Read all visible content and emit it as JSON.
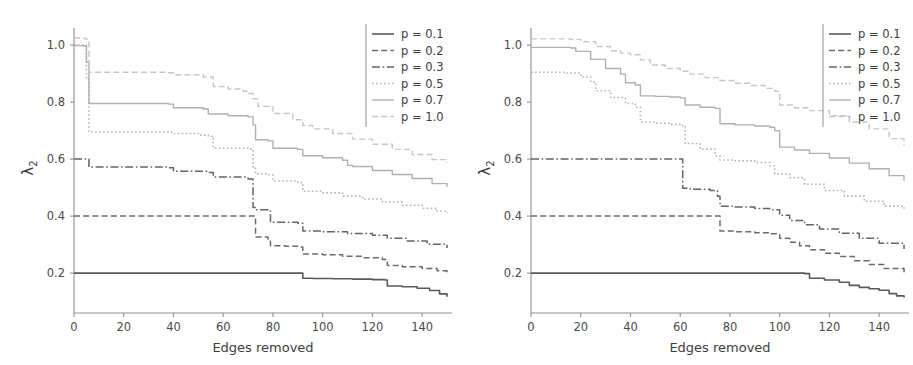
{
  "figure": {
    "background_color": "#ffffff",
    "panel_count": 2
  },
  "chart_data": [
    {
      "type": "line",
      "panel": "left",
      "title": "",
      "subtitle": "",
      "xlabel": "Edges removed",
      "ylabel": "λ₂",
      "xlim": [
        0,
        152
      ],
      "ylim": [
        0.06,
        1.06
      ],
      "xticks": [
        0,
        20,
        40,
        60,
        80,
        100,
        120,
        140
      ],
      "xtick_labels": [
        "0",
        "20",
        "40",
        "60",
        "80",
        "100",
        "120",
        "140"
      ],
      "yticks": [
        0.2,
        0.4,
        0.6,
        0.8,
        1.0
      ],
      "ytick_labels": [
        "0.2",
        "0.4",
        "0.6",
        "0.8",
        "1.0"
      ],
      "grid": false,
      "legend_position": "upper right",
      "legend_entries": [
        "p = 0.1",
        "p = 0.2",
        "p = 0.3",
        "p = 0.5",
        "p = 0.7",
        "p = 1.0"
      ],
      "series": [
        {
          "name": "p = 0.1",
          "color": "#5a5a5a",
          "linestyle": "solid",
          "linewidth": 1.6,
          "x": [
            0,
            91,
            92,
            96,
            104,
            112,
            120,
            125,
            126,
            132,
            138,
            143,
            147,
            150
          ],
          "values": [
            0.2,
            0.2,
            0.182,
            0.181,
            0.18,
            0.179,
            0.177,
            0.176,
            0.155,
            0.152,
            0.147,
            0.139,
            0.127,
            0.117
          ]
        },
        {
          "name": "p = 0.2",
          "color": "#6a6a6a",
          "linestyle": "dashed",
          "linewidth": 1.5,
          "x": [
            0,
            72,
            73,
            78,
            79,
            85,
            91,
            92,
            100,
            108,
            116,
            124,
            126,
            132,
            140,
            146,
            150
          ],
          "values": [
            0.4,
            0.4,
            0.327,
            0.32,
            0.296,
            0.294,
            0.292,
            0.267,
            0.264,
            0.259,
            0.254,
            0.248,
            0.227,
            0.222,
            0.216,
            0.208,
            0.202
          ]
        },
        {
          "name": "p = 0.3",
          "color": "#646464",
          "linestyle": "dashdot",
          "linewidth": 1.5,
          "x": [
            0,
            5,
            6,
            38,
            40,
            54,
            56,
            70,
            72,
            73,
            78,
            79,
            90,
            92,
            100,
            110,
            120,
            126,
            134,
            142,
            150
          ],
          "values": [
            0.6,
            0.6,
            0.572,
            0.57,
            0.557,
            0.553,
            0.537,
            0.53,
            0.43,
            0.422,
            0.418,
            0.378,
            0.375,
            0.348,
            0.345,
            0.339,
            0.333,
            0.322,
            0.313,
            0.301,
            0.288
          ]
        },
        {
          "name": "p = 0.5",
          "color": "#b4b4b4",
          "linestyle": "dotted",
          "linewidth": 1.6,
          "x": [
            0,
            4,
            5,
            6,
            38,
            40,
            50,
            54,
            56,
            70,
            72,
            73,
            78,
            80,
            90,
            92,
            100,
            108,
            116,
            124,
            132,
            140,
            146,
            150
          ],
          "values": [
            1.0,
            1.0,
            0.88,
            0.695,
            0.694,
            0.69,
            0.684,
            0.68,
            0.638,
            0.635,
            0.572,
            0.548,
            0.545,
            0.523,
            0.518,
            0.487,
            0.482,
            0.47,
            0.46,
            0.449,
            0.438,
            0.427,
            0.418,
            0.412
          ]
        },
        {
          "name": "p = 0.7",
          "color": "#b0b0b0",
          "linestyle": "solid",
          "linewidth": 1.4,
          "x": [
            0,
            4,
            5,
            6,
            38,
            40,
            52,
            54,
            62,
            70,
            72,
            73,
            78,
            80,
            90,
            92,
            100,
            108,
            110,
            112,
            120,
            128,
            136,
            144,
            150
          ],
          "values": [
            0.998,
            0.996,
            0.94,
            0.795,
            0.793,
            0.78,
            0.776,
            0.758,
            0.752,
            0.748,
            0.72,
            0.668,
            0.664,
            0.638,
            0.634,
            0.612,
            0.605,
            0.596,
            0.578,
            0.574,
            0.56,
            0.546,
            0.532,
            0.514,
            0.503
          ]
        },
        {
          "name": "p = 1.0",
          "color": "#c6c6c6",
          "linestyle": "dashed",
          "linewidth": 1.4,
          "x": [
            0,
            4,
            5,
            6,
            38,
            40,
            52,
            56,
            62,
            68,
            70,
            72,
            74,
            80,
            88,
            92,
            96,
            104,
            112,
            120,
            128,
            136,
            144,
            150
          ],
          "values": [
            1.025,
            1.023,
            1.02,
            0.905,
            0.903,
            0.896,
            0.888,
            0.855,
            0.846,
            0.838,
            0.83,
            0.812,
            0.785,
            0.76,
            0.738,
            0.718,
            0.706,
            0.69,
            0.67,
            0.652,
            0.634,
            0.616,
            0.598,
            0.588
          ]
        }
      ]
    },
    {
      "type": "line",
      "panel": "right",
      "title": "",
      "subtitle": "",
      "xlabel": "Edges removed",
      "ylabel": "λ₂",
      "xlim": [
        0,
        152
      ],
      "ylim": [
        0.06,
        1.06
      ],
      "xticks": [
        0,
        20,
        40,
        60,
        80,
        100,
        120,
        140
      ],
      "xtick_labels": [
        "0",
        "20",
        "40",
        "60",
        "80",
        "100",
        "120",
        "140"
      ],
      "yticks": [
        0.2,
        0.4,
        0.6,
        0.8,
        1.0
      ],
      "ytick_labels": [
        "0.2",
        "0.4",
        "0.6",
        "0.8",
        "1.0"
      ],
      "grid": false,
      "legend_position": "upper right",
      "legend_entries": [
        "p = 0.1",
        "p = 0.2",
        "p = 0.3",
        "p = 0.5",
        "p = 0.7",
        "p = 1.0"
      ],
      "series": [
        {
          "name": "p = 0.1",
          "color": "#5a5a5a",
          "linestyle": "solid",
          "linewidth": 1.6,
          "x": [
            0,
            108,
            110,
            112,
            118,
            124,
            128,
            132,
            136,
            140,
            144,
            147,
            150
          ],
          "values": [
            0.2,
            0.2,
            0.198,
            0.182,
            0.176,
            0.168,
            0.157,
            0.15,
            0.145,
            0.14,
            0.128,
            0.12,
            0.114
          ]
        },
        {
          "name": "p = 0.2",
          "color": "#6a6a6a",
          "linestyle": "dashed",
          "linewidth": 1.5,
          "x": [
            0,
            75,
            76,
            82,
            90,
            96,
            100,
            104,
            108,
            112,
            118,
            124,
            130,
            136,
            142,
            150
          ],
          "values": [
            0.4,
            0.4,
            0.348,
            0.345,
            0.342,
            0.338,
            0.322,
            0.308,
            0.296,
            0.282,
            0.27,
            0.258,
            0.243,
            0.23,
            0.216,
            0.2
          ]
        },
        {
          "name": "p = 0.3",
          "color": "#646464",
          "linestyle": "dashdot",
          "linewidth": 1.5,
          "x": [
            0,
            60,
            61,
            64,
            72,
            75,
            76,
            82,
            90,
            96,
            100,
            104,
            110,
            116,
            124,
            132,
            140,
            150
          ],
          "values": [
            0.6,
            0.6,
            0.498,
            0.494,
            0.49,
            0.47,
            0.435,
            0.432,
            0.427,
            0.422,
            0.403,
            0.385,
            0.37,
            0.355,
            0.34,
            0.322,
            0.305,
            0.285
          ]
        },
        {
          "name": "p = 0.5",
          "color": "#b4b4b4",
          "linestyle": "dotted",
          "linewidth": 1.6,
          "x": [
            0,
            14,
            20,
            24,
            26,
            32,
            38,
            42,
            44,
            50,
            56,
            60,
            62,
            68,
            74,
            76,
            82,
            90,
            96,
            98,
            104,
            110,
            118,
            126,
            134,
            142,
            150
          ],
          "values": [
            0.905,
            0.902,
            0.888,
            0.87,
            0.84,
            0.816,
            0.795,
            0.782,
            0.73,
            0.726,
            0.722,
            0.718,
            0.655,
            0.635,
            0.612,
            0.597,
            0.594,
            0.588,
            0.576,
            0.548,
            0.535,
            0.512,
            0.49,
            0.47,
            0.452,
            0.435,
            0.418
          ]
        },
        {
          "name": "p = 0.7",
          "color": "#b0b0b0",
          "linestyle": "solid",
          "linewidth": 1.4,
          "x": [
            0,
            16,
            18,
            24,
            30,
            36,
            38,
            42,
            44,
            50,
            56,
            60,
            62,
            68,
            74,
            76,
            82,
            90,
            96,
            98,
            100,
            106,
            112,
            120,
            128,
            136,
            144,
            150
          ],
          "values": [
            0.992,
            0.99,
            0.978,
            0.95,
            0.918,
            0.898,
            0.868,
            0.86,
            0.822,
            0.82,
            0.818,
            0.815,
            0.79,
            0.782,
            0.778,
            0.724,
            0.72,
            0.716,
            0.712,
            0.7,
            0.642,
            0.632,
            0.62,
            0.604,
            0.586,
            0.566,
            0.542,
            0.524
          ]
        },
        {
          "name": "p = 1.0",
          "color": "#c6c6c6",
          "linestyle": "dashed",
          "linewidth": 1.4,
          "x": [
            0,
            16,
            20,
            26,
            32,
            36,
            40,
            44,
            48,
            54,
            60,
            64,
            70,
            76,
            82,
            88,
            94,
            98,
            100,
            106,
            112,
            120,
            128,
            136,
            144,
            150
          ],
          "values": [
            1.022,
            1.02,
            1.012,
            0.995,
            0.98,
            0.972,
            0.966,
            0.948,
            0.93,
            0.918,
            0.908,
            0.898,
            0.886,
            0.876,
            0.866,
            0.858,
            0.848,
            0.838,
            0.79,
            0.78,
            0.77,
            0.752,
            0.73,
            0.706,
            0.672,
            0.648
          ]
        }
      ]
    }
  ]
}
